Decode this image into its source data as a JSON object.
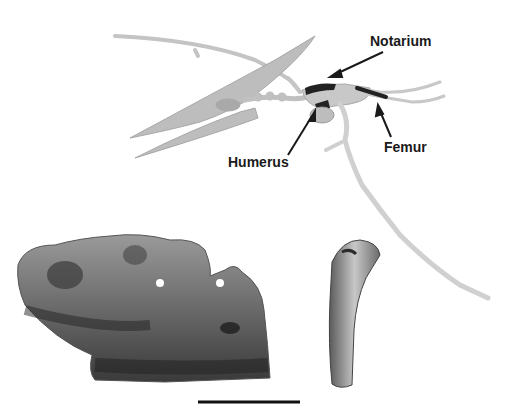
{
  "figure": {
    "skeleton": {
      "description": "pterosaur skeleton in flight pose, highlighted bones",
      "bone_color": "#c8c8c8",
      "highlight_color": "#222222"
    },
    "labels": [
      {
        "id": "notarium",
        "text": "Notarium"
      },
      {
        "id": "humerus",
        "text": "Humerus"
      },
      {
        "id": "femur",
        "text": "Femur"
      }
    ],
    "specimens": [
      {
        "id": "notarium-fossil",
        "description": "fossil notarium fragment drawing"
      },
      {
        "id": "humerus-fossil",
        "description": "fossil humerus bone drawing"
      }
    ],
    "scale_bar": {
      "color": "#111111"
    }
  }
}
